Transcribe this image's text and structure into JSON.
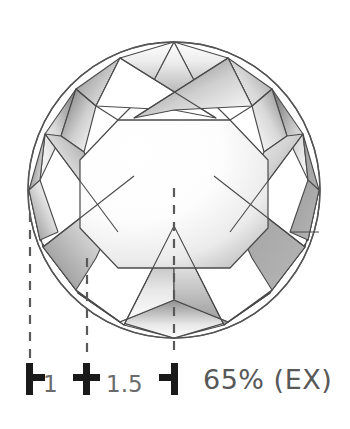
{
  "figure": {
    "type": "diamond-proportion-diagram",
    "view": "crown-top-view",
    "shape": "round-brilliant",
    "background_color": "#ffffff",
    "outline_color": "#555555"
  },
  "gem": {
    "outline": {
      "cx": 174,
      "cy": 190,
      "rx": 146,
      "ry": 148
    },
    "table_label": "",
    "facet_line_color": "#4a4a4a",
    "shade_light": "#ffffff",
    "shade_dark": "#7d7d7d"
  },
  "measure": {
    "dashed_line_color": "#5a5a5a",
    "guides": [
      {
        "name": "girdle-left-guide",
        "x": 30,
        "y1": 213,
        "y2": 355
      },
      {
        "name": "mid-guide",
        "x": 87,
        "y1": 258,
        "y2": 355
      },
      {
        "name": "center-guide",
        "x": 174,
        "y1": 188,
        "y2": 355
      }
    ],
    "ticks": [
      {
        "name": "tick-start",
        "glyph": "left-bracket",
        "x": 30,
        "y": 379
      },
      {
        "name": "tick-mid",
        "glyph": "cross",
        "x": 87,
        "y": 379
      },
      {
        "name": "tick-end",
        "glyph": "right-bracket",
        "x": 174,
        "y": 379
      }
    ],
    "tick_labels": [
      {
        "name": "tick-label-1",
        "text": "1"
      },
      {
        "name": "tick-label-1-5",
        "text": "1.5"
      }
    ]
  },
  "readout": {
    "depth_percent": "65%",
    "grade": "(EX)",
    "combined": "65% (EX)"
  }
}
